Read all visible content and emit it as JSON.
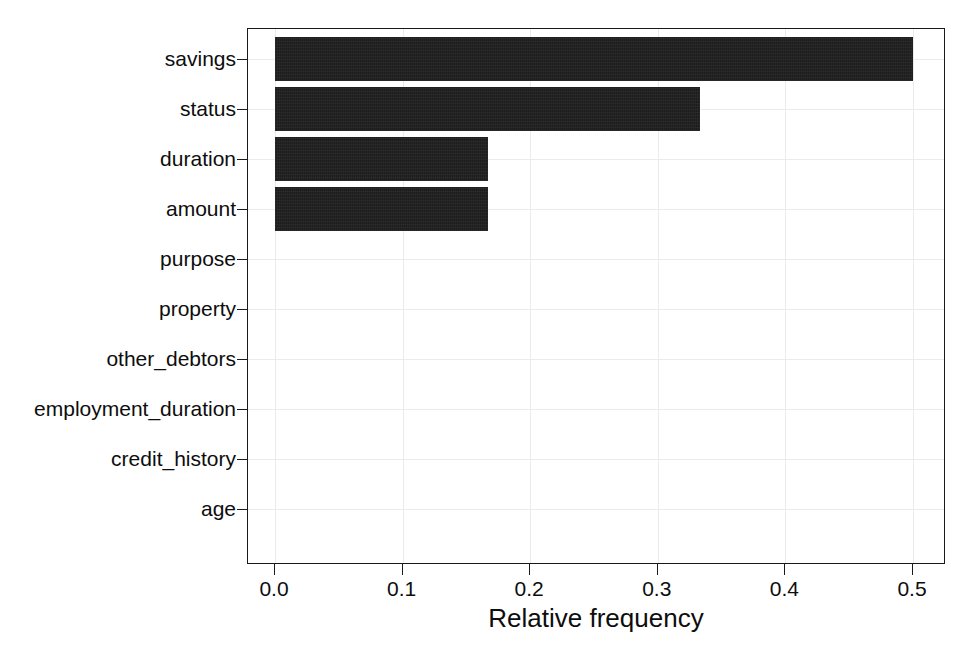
{
  "chart_data": {
    "type": "bar",
    "orientation": "horizontal",
    "title": "",
    "xlabel": "Relative frequency",
    "ylabel": "",
    "categories": [
      "savings",
      "status",
      "duration",
      "amount",
      "purpose",
      "property",
      "other_debtors",
      "employment_duration",
      "credit_history",
      "age"
    ],
    "values": [
      0.5,
      0.333,
      0.167,
      0.167,
      0.0,
      0.0,
      0.0,
      0.0,
      0.0,
      0.0
    ],
    "xlim": [
      0.0,
      0.5466
    ],
    "xticks": [
      0.0,
      0.1,
      0.2,
      0.3,
      0.4,
      0.5
    ],
    "xticklabels": [
      "0.0",
      "0.1",
      "0.2",
      "0.3",
      "0.4",
      "0.5"
    ],
    "grid": true,
    "legend": null,
    "bar_color": "#1d1d1d",
    "background_color": "#ffffff",
    "gridline_color": "#eceaea",
    "axis_color": "#1a1a1a"
  }
}
